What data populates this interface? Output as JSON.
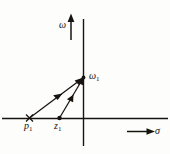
{
  "figure": {
    "type": "pole-zero-plot",
    "background_color": "#fdfdfc",
    "ink_color": "#17140f"
  },
  "axes": {
    "vertical": {
      "name": "imaginary-axis",
      "label": "ω",
      "label_symbol": "omega",
      "arrow_direction": "up"
    },
    "horizontal": {
      "name": "real-axis",
      "label": "σ",
      "label_symbol": "sigma",
      "arrow_direction": "right"
    }
  },
  "points": [
    {
      "id": "omega-1",
      "label_base": "ω",
      "label_sub": "1",
      "marker": "dot",
      "location": "on imaginary axis"
    },
    {
      "id": "p-1",
      "label_base": "p",
      "label_sub": "1",
      "marker": "cross",
      "location": "on negative real axis"
    },
    {
      "id": "z-1",
      "label_base": "z",
      "label_sub": "1",
      "marker": "dot",
      "location": "on negative real axis"
    }
  ],
  "vectors": [
    {
      "id": "vector-p1-to-omega1",
      "from": "p-1",
      "to": "omega-1",
      "arrowheads": "midpoint and tip"
    },
    {
      "id": "vector-z1-to-omega1",
      "from": "z-1",
      "to": "omega-1",
      "arrowheads": "midpoint and tip"
    }
  ]
}
